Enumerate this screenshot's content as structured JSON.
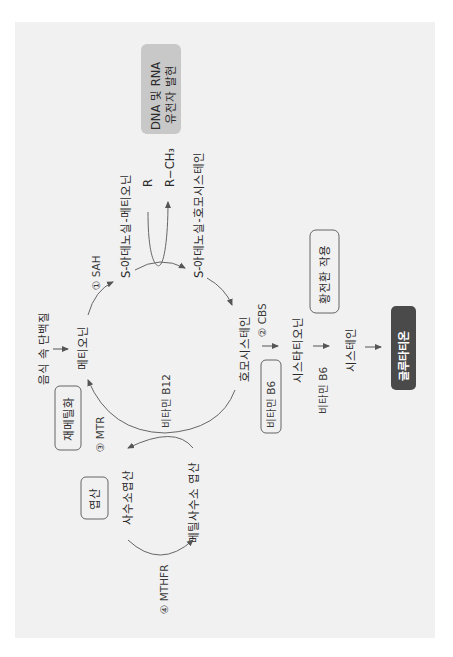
{
  "diagram": {
    "orientation": "rotated-90-ccw",
    "nodes": {
      "dietary_protein": "음식 속 단백질",
      "methionine": "메티오닌",
      "sam": "S-아데노실-메티오닌",
      "sah": "S-아데노실-호모시스테인",
      "homocysteine": "호모시스테인",
      "cystathionine": "시스타티오닌",
      "cysteine": "시스테인",
      "glutathione": "글루타티온",
      "thf": "사수소엽산",
      "methyl_thf": "메틸사수소 엽산",
      "r": "R",
      "r_ch3": "R−CH₃"
    },
    "enzymes": {
      "sah_enzyme": "① SAH",
      "cbs": "② CBS",
      "mtr": "③ MTR",
      "mthfr": "④ MTHFR"
    },
    "cofactors": {
      "b12": "비타민 B12",
      "b6_box": "비타민 B6",
      "b6_label": "비타민 B6"
    },
    "boxes": {
      "dna_rna_line1": "DNA 및 RNA",
      "dna_rna_line2": "유전자 발현",
      "remethylation": "재메틸화",
      "folate": "엽산",
      "transsulfuration": "황전환 작용",
      "glutathione_box": "글루타티온"
    },
    "colors": {
      "panel": "#f1f1f1",
      "gray_box": "#c8c8c8",
      "dark_box": "#4a4a4a",
      "text": "#2b2b2b",
      "line": "#666666"
    }
  }
}
